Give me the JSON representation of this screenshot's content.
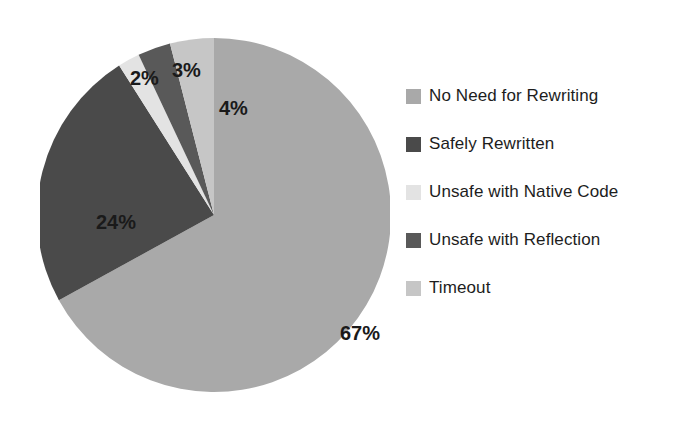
{
  "chart_data": {
    "type": "pie",
    "title": "",
    "subtitle": "",
    "xlabel": "",
    "ylabel": "",
    "grid": false,
    "legend_position": "right",
    "start_angle_deg": 0,
    "direction": "clockwise",
    "categories": [
      "No Need for Rewriting",
      "Safely Rewritten",
      "Unsafe with Native Code",
      "Unsafe with Reflection",
      "Timeout"
    ],
    "values": [
      67,
      24,
      2,
      3,
      4
    ],
    "value_unit": "%",
    "data_labels": [
      "67%",
      "24%",
      "2%",
      "3%",
      "4%"
    ],
    "colors": [
      "#a9a9a9",
      "#4a4a4a",
      "#e3e3e3",
      "#595959",
      "#c6c6c6"
    ],
    "slices": [
      {
        "label": "No Need for Rewriting",
        "value": 67,
        "data_label": "67%",
        "color": "#a9a9a9"
      },
      {
        "label": "Safely Rewritten",
        "value": 24,
        "data_label": "24%",
        "color": "#4a4a4a"
      },
      {
        "label": "Unsafe with Native Code",
        "value": 2,
        "data_label": "2%",
        "color": "#e3e3e3"
      },
      {
        "label": "Unsafe with Reflection",
        "value": 3,
        "data_label": "3%",
        "color": "#595959"
      },
      {
        "label": "Timeout",
        "value": 4,
        "data_label": "4%",
        "color": "#c6c6c6"
      }
    ]
  },
  "legend": {
    "items": [
      {
        "label": "No Need for Rewriting",
        "color": "#a9a9a9"
      },
      {
        "label": "Safely Rewritten",
        "color": "#4a4a4a"
      },
      {
        "label": "Unsafe with Native Code",
        "color": "#e3e3e3"
      },
      {
        "label": "Unsafe with Reflection",
        "color": "#595959"
      },
      {
        "label": "Timeout",
        "color": "#c6c6c6"
      }
    ]
  },
  "labels": {
    "pct_0": "67%",
    "pct_1": "24%",
    "pct_2": "2%",
    "pct_3": "3%",
    "pct_4": "4%"
  }
}
